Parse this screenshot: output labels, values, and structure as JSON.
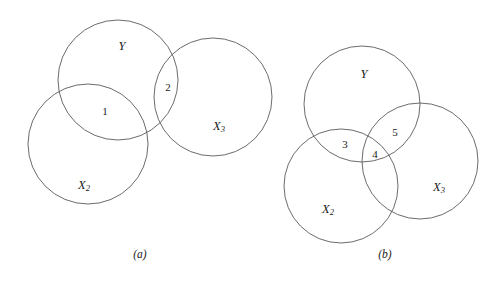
{
  "figure": {
    "type": "venn-diagram",
    "width": 494,
    "height": 287,
    "background_color": "#ffffff",
    "stroke_color": "#5a5a5a",
    "text_color": "#1a1a1a"
  },
  "panels": [
    {
      "id": "a",
      "caption": "(a)",
      "caption_x": 140,
      "caption_y": 255,
      "circles": [
        {
          "name": "Y",
          "label": "Y",
          "sub": "",
          "cx": 118,
          "cy": 80,
          "r": 60,
          "label_x": 122,
          "label_y": 47
        },
        {
          "name": "X2",
          "label": "X",
          "sub": "2",
          "cx": 88,
          "cy": 144,
          "r": 60,
          "label_x": 84,
          "label_y": 186
        },
        {
          "name": "X3",
          "label": "X",
          "sub": "3",
          "cx": 213,
          "cy": 97,
          "r": 59,
          "label_x": 219,
          "label_y": 127
        }
      ],
      "regions": [
        {
          "number": "1",
          "x": 105,
          "y": 112
        },
        {
          "number": "2",
          "x": 168,
          "y": 88
        }
      ]
    },
    {
      "id": "b",
      "caption": "(b)",
      "caption_x": 385,
      "caption_y": 255,
      "circles": [
        {
          "name": "Y",
          "label": "Y",
          "sub": "",
          "cx": 362,
          "cy": 104,
          "r": 58,
          "label_x": 364,
          "label_y": 75
        },
        {
          "name": "X2",
          "label": "X",
          "sub": "2",
          "cx": 341,
          "cy": 186,
          "r": 57,
          "label_x": 328,
          "label_y": 210
        },
        {
          "name": "X3",
          "label": "X",
          "sub": "3",
          "cx": 420,
          "cy": 161,
          "r": 58,
          "label_x": 439,
          "label_y": 188
        }
      ],
      "regions": [
        {
          "number": "3",
          "x": 345,
          "y": 145
        },
        {
          "number": "4",
          "x": 375,
          "y": 155
        },
        {
          "number": "5",
          "x": 395,
          "y": 133
        }
      ]
    }
  ]
}
